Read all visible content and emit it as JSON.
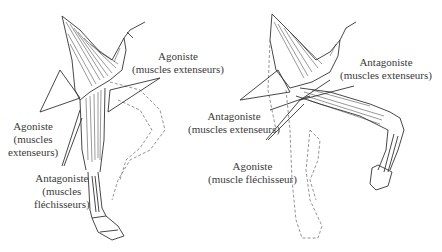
{
  "figure": {
    "left_panel": {
      "labels": [
        {
          "title": "Agoniste",
          "lines": [
            "(muscles extenseurs)"
          ]
        },
        {
          "title": "Agoniste",
          "lines": [
            "(muscles",
            "extenseurs)"
          ]
        },
        {
          "title": "Antagoniste",
          "lines": [
            "(muscles",
            "fléchisseurs)"
          ]
        }
      ]
    },
    "right_panel": {
      "labels": [
        {
          "title": "Antagoniste",
          "lines": [
            "(muscles extenseurs)"
          ]
        },
        {
          "title": "Antagoniste",
          "lines": [
            "(muscles extenseurs)"
          ]
        },
        {
          "title": "Agoniste",
          "lines": [
            "(muscle fléchisseur)"
          ]
        }
      ]
    },
    "colors": {
      "line": "#333333",
      "dashed": "#888888",
      "text": "#3a3a3a"
    }
  }
}
